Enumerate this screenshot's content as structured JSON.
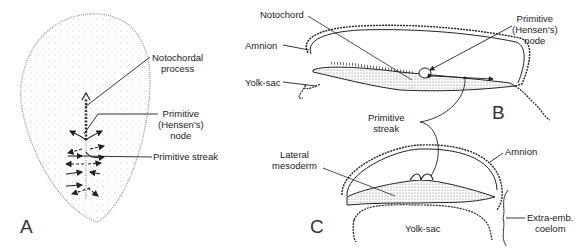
{
  "figure": {
    "panels": [
      {
        "id": "A",
        "letter": "A",
        "description": "Dorsal view of embryonic disc showing primitive streak and cell migration",
        "labels": {
          "notochordal_process_1": "Notochordal",
          "notochordal_process_2": "process",
          "primitive_node_1": "Primitive",
          "primitive_node_2": "(Hensen's)",
          "primitive_node_3": "node",
          "primitive_streak": "Primitive streak"
        }
      },
      {
        "id": "B",
        "letter": "B",
        "description": "Sagittal section of embryo",
        "labels": {
          "notochord": "Notochord",
          "amnion": "Amnion",
          "yolk_sac": "Yolk-sac",
          "primitive_node_1": "Primitive",
          "primitive_node_2": "(Hensen's)",
          "primitive_node_3": "node"
        }
      },
      {
        "id": "C",
        "letter": "C",
        "description": "Transverse section through primitive streak",
        "labels": {
          "lateral_mesoderm_1": "Lateral",
          "lateral_mesoderm_2": "mesoderm",
          "amnion": "Amnion",
          "yolk_sac": "Yolk-sac",
          "extra_emb_coelom_1": "Extra-emb.",
          "extra_emb_coelom_2": "coelom"
        }
      }
    ],
    "shared_labels": {
      "primitive_streak_1": "Primitive",
      "primitive_streak_2": "streak"
    },
    "colors": {
      "ink": "#1a1a1a",
      "stipple": "#8a8a8a",
      "background": "#ffffff"
    }
  }
}
